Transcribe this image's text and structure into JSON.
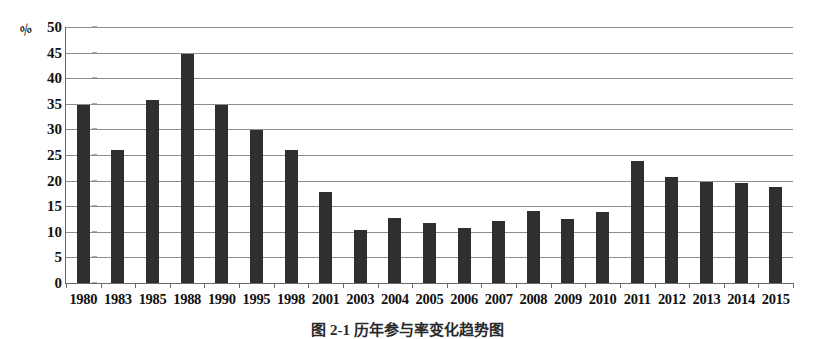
{
  "chart_data": {
    "type": "bar",
    "title": "",
    "xlabel": "",
    "ylabel": "%",
    "ylim": [
      0,
      50
    ],
    "ytick_step": 5,
    "grid": true,
    "legend": null,
    "bar_color": "#2f2f2f",
    "categories": [
      "1980",
      "1983",
      "1985",
      "1988",
      "1990",
      "1995",
      "1998",
      "2001",
      "2003",
      "2004",
      "2005",
      "2006",
      "2007",
      "2008",
      "2009",
      "2010",
      "2011",
      "2012",
      "2013",
      "2014",
      "2015"
    ],
    "values": [
      34.8,
      26.0,
      35.8,
      44.8,
      34.7,
      29.8,
      25.9,
      17.8,
      10.3,
      12.7,
      11.7,
      10.7,
      12.1,
      14.0,
      12.6,
      13.9,
      23.9,
      20.7,
      19.7,
      19.5,
      18.7
    ],
    "yticks": [
      "0",
      "5",
      "10",
      "15",
      "20",
      "25",
      "30",
      "35",
      "40",
      "45",
      "50"
    ],
    "ytick_values": [
      0,
      5,
      10,
      15,
      20,
      25,
      30,
      35,
      40,
      45,
      50
    ]
  },
  "caption": {
    "text": "图 2-1 历年参与率变化趋势图",
    "truncated": true
  }
}
